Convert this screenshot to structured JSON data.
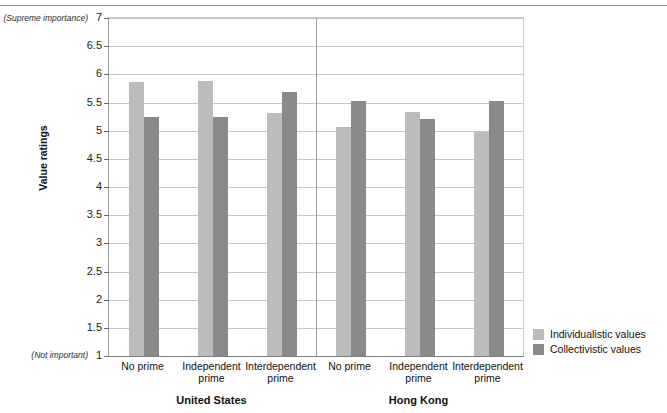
{
  "figure": {
    "top_rule": true,
    "axis_endpoint_labels": {
      "top": "(Supreme importance)",
      "bottom": "(Not important)"
    }
  },
  "legend": {
    "position": "right-bottom",
    "items": [
      {
        "label": "Individualistic values",
        "color": "#bcbcbc",
        "swatch": "light-gray-swatch"
      },
      {
        "label": "Collectivistic values",
        "color": "#8a8a8a",
        "swatch": "dark-gray-swatch"
      }
    ]
  },
  "chart_data": {
    "type": "bar",
    "title": "",
    "xlabel": "",
    "ylabel": "Value ratings",
    "ylim": [
      1,
      7
    ],
    "yticks": [
      1,
      1.5,
      2,
      2.5,
      3,
      3.5,
      4,
      4.5,
      5,
      5.5,
      6,
      6.5,
      7
    ],
    "ytick_labels": [
      "1",
      "1.5",
      "2",
      "2.5",
      "3",
      "3.5",
      "4",
      "4.5",
      "5",
      "5.5",
      "6",
      "6.5",
      "7"
    ],
    "y_axis_endpoint_annotations": {
      "1": "(Not important)",
      "7": "(Supreme importance)"
    },
    "grid": true,
    "grid_axis": "y",
    "legend_position": "right",
    "groups": [
      {
        "name": "United States",
        "categories": [
          "No prime",
          "Independent prime",
          "Interdependent prime"
        ]
      },
      {
        "name": "Hong Kong",
        "categories": [
          "No prime",
          "Independent prime",
          "Interdependent prime"
        ]
      }
    ],
    "categories": [
      "United States / No prime",
      "United States / Independent prime",
      "United States / Interdependent prime",
      "Hong Kong / No prime",
      "Hong Kong / Independent prime",
      "Hong Kong / Interdependent prime"
    ],
    "series": [
      {
        "name": "Individualistic values",
        "color": "#bcbcbc",
        "values": [
          5.87,
          5.88,
          5.32,
          5.07,
          5.34,
          4.97
        ]
      },
      {
        "name": "Collectivistic values",
        "color": "#8a8a8a",
        "values": [
          5.25,
          5.25,
          5.68,
          5.52,
          5.21,
          5.53
        ]
      }
    ]
  }
}
